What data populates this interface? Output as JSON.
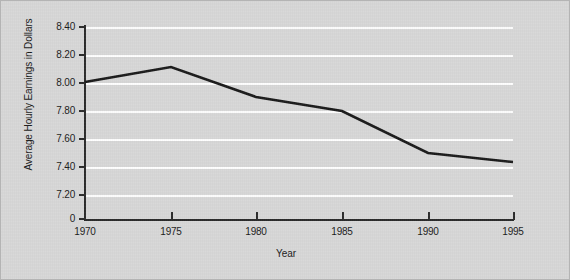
{
  "chart_data": {
    "type": "line",
    "title": "",
    "xlabel": "Year",
    "ylabel": "Average Hourly Earnings in Dollars",
    "x": [
      1970,
      1975,
      1980,
      1985,
      1990,
      1995
    ],
    "series": [
      {
        "name": "Average Hourly Earnings",
        "values": [
          8.01,
          8.12,
          7.9,
          7.8,
          7.5,
          7.42
        ]
      }
    ],
    "xticks": [
      "1970",
      "1975",
      "1980",
      "1985",
      "1990",
      "1995"
    ],
    "yticks": [
      "8.40",
      "8.20",
      "8.00",
      "7.80",
      "7.60",
      "7.40",
      "7.20",
      "0"
    ],
    "ytick_values": [
      8.4,
      8.2,
      8.0,
      7.8,
      7.6,
      7.4,
      7.2,
      0
    ],
    "xlim": [
      1970,
      1995
    ],
    "ylim": [
      7.1,
      8.45
    ],
    "grid": "horizontal",
    "gridline_color": "#ffffff",
    "legend": "none",
    "line_color": "#1a1a1a",
    "background_color": "#d8d8d8",
    "border_color": "#b4b4b4",
    "axis_color": "#2b2b2b"
  },
  "axes": {
    "y_labels": [
      {
        "text": "8.40",
        "top": 21
      },
      {
        "text": "8.20",
        "top": 49
      },
      {
        "text": "8.00",
        "top": 77
      },
      {
        "text": "7.80",
        "top": 105
      },
      {
        "text": "7.60",
        "top": 133
      },
      {
        "text": "7.40",
        "top": 161
      },
      {
        "text": "7.20",
        "top": 189
      },
      {
        "text": "0",
        "top": 213
      }
    ],
    "y_grid_tops": [
      0,
      28,
      56,
      84,
      112,
      140,
      168
    ],
    "y_tick_tops": [
      25,
      53,
      81,
      109,
      137,
      165,
      193,
      217
    ],
    "x_labels": [
      {
        "text": "1970",
        "left": 84
      },
      {
        "text": "1975",
        "left": 170
      },
      {
        "text": "1980",
        "left": 255
      },
      {
        "text": "1985",
        "left": 341
      },
      {
        "text": "1990",
        "left": 427
      },
      {
        "text": "1995",
        "left": 512
      }
    ],
    "x_tick_lefts": [
      170,
      255,
      341,
      427,
      512
    ],
    "polyline_points": "84,81 170,66 255,96 341,110 427,152 512,161"
  }
}
